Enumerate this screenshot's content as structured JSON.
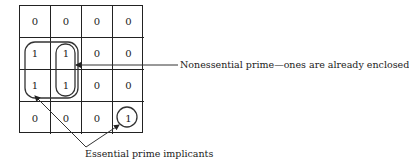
{
  "kmap": {
    "rows": 4,
    "cols": 4,
    "cells": [
      [
        "0",
        "0",
        "0",
        "0"
      ],
      [
        "1",
        "1",
        "0",
        "0"
      ],
      [
        "1",
        "1",
        "0",
        "0"
      ],
      [
        "0",
        "0",
        "0",
        "1"
      ]
    ]
  },
  "annotations": {
    "nonessential": "Nonessential prime—ones are already enclosed",
    "essential": "Essential prime implicants"
  },
  "groupings": [
    {
      "name": "essential-quad",
      "cells": [
        [
          1,
          0
        ],
        [
          1,
          1
        ],
        [
          2,
          0
        ],
        [
          2,
          1
        ]
      ],
      "type": "essential"
    },
    {
      "name": "nonessential-pair",
      "cells": [
        [
          1,
          1
        ],
        [
          2,
          1
        ]
      ],
      "type": "nonessential"
    },
    {
      "name": "essential-single",
      "cells": [
        [
          3,
          3
        ]
      ],
      "type": "essential"
    }
  ]
}
